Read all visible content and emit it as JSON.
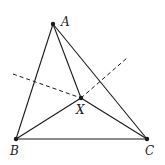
{
  "diagram": {
    "title": "",
    "points": {
      "A": {
        "label": "A",
        "x": 53,
        "y": 24,
        "lx": 61,
        "ly": 26
      },
      "B": {
        "label": "B",
        "x": 16,
        "y": 139,
        "lx": 10,
        "ly": 155
      },
      "C": {
        "label": "C",
        "x": 147,
        "y": 139,
        "lx": 145,
        "ly": 155
      },
      "X": {
        "label": "X",
        "x": 81,
        "y": 98,
        "lx": 76,
        "ly": 114
      }
    },
    "segments": [
      [
        "A",
        "B"
      ],
      [
        "B",
        "C"
      ],
      [
        "C",
        "A"
      ],
      [
        "A",
        "X"
      ],
      [
        "B",
        "X"
      ],
      [
        "C",
        "X"
      ]
    ],
    "dashed_lines": [
      {
        "x1": 13,
        "y1": 74,
        "x2": 81,
        "y2": 98
      },
      {
        "x1": 81,
        "y1": 98,
        "x2": 127,
        "y2": 58
      }
    ],
    "colors": {
      "stroke": "#1a1a1a",
      "background": "#ffffff"
    }
  }
}
